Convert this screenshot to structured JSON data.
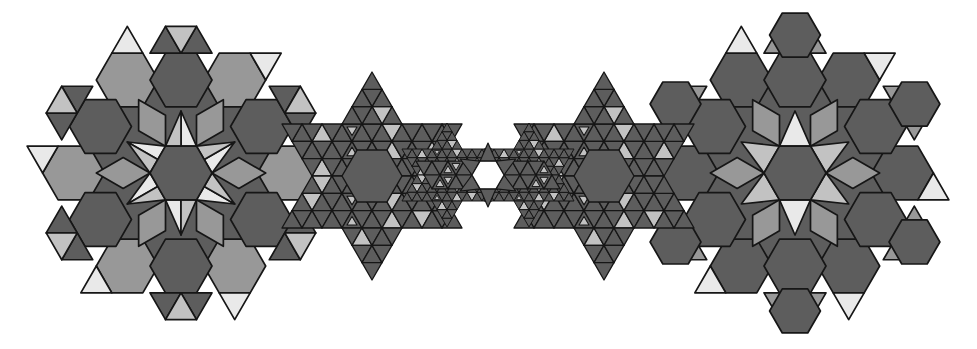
{
  "canvas": {
    "width": 977,
    "height": 349,
    "background": "#ffffff",
    "stroke_color": "#161616"
  },
  "palette": {
    "dark": "#5d5d5d",
    "mid": "#989898",
    "light": "#c2c2c2",
    "pale": "#e9e9e9",
    "hole": "#ffffff"
  },
  "clusters": [
    {
      "kind": "flower",
      "variant": "split-star",
      "cx": 181,
      "cy": 173,
      "unit": 31,
      "stroke_width": 1.7
    },
    {
      "kind": "flower",
      "variant": "hexagram",
      "cx": 795,
      "cy": 173,
      "unit": 31,
      "stroke_width": 1.7
    },
    {
      "kind": "fractal",
      "cx": 372,
      "cy": 176,
      "unit": 20,
      "stroke_width": 1.3
    },
    {
      "kind": "fractal",
      "cx": 604,
      "cy": 176,
      "unit": 20,
      "stroke_width": 1.3
    },
    {
      "kind": "fractal",
      "cx": 447,
      "cy": 175,
      "unit": 10,
      "stroke_width": 1.0
    },
    {
      "kind": "fractal",
      "cx": 529,
      "cy": 175,
      "unit": 10,
      "stroke_width": 1.0
    },
    {
      "kind": "neck",
      "cx": 488,
      "cy": 175,
      "unit": 16,
      "stroke_width": 1.2
    }
  ]
}
